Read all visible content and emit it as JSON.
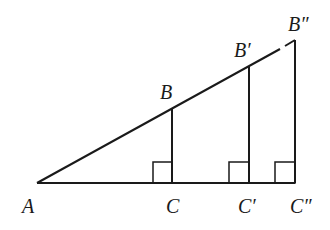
{
  "diagram": {
    "type": "similar-right-triangles",
    "background": "#ffffff",
    "stroke_color": "#1a1a1a",
    "points": {
      "A": {
        "label": "A",
        "x": 37,
        "y": 183
      },
      "B": {
        "label": "B",
        "x": 172,
        "y": 108
      },
      "C": {
        "label": "C",
        "x": 172,
        "y": 183
      },
      "B1": {
        "label": "B′",
        "x": 249,
        "y": 66
      },
      "C1": {
        "label": "C′",
        "x": 249,
        "y": 183
      },
      "B2": {
        "label": "B″",
        "x": 295,
        "y": 40
      },
      "C2": {
        "label": "C″",
        "x": 295,
        "y": 183
      }
    },
    "segments": [
      {
        "from": "A",
        "to": "B1",
        "style": "solid"
      },
      {
        "from": "B1",
        "to": "B2",
        "style": "dashed-gap"
      },
      {
        "from": "A",
        "to": "C2",
        "style": "solid"
      },
      {
        "from": "B",
        "to": "C",
        "style": "solid"
      },
      {
        "from": "B1",
        "to": "C1",
        "style": "solid"
      },
      {
        "from": "B2",
        "to": "C2",
        "style": "solid"
      }
    ],
    "right_angle_markers": [
      "C",
      "C1",
      "C2"
    ],
    "labels": {
      "A": "A",
      "B": "B",
      "C": "C",
      "B1": "B′",
      "C1": "C′",
      "B2": "B″",
      "C2": "C″"
    }
  }
}
